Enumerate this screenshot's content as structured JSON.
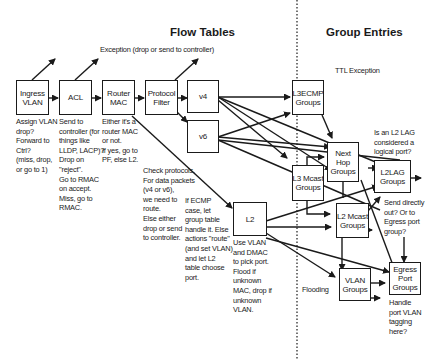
{
  "titles": {
    "flow_tables": "Flow Tables",
    "group_entries": "Group Entries"
  },
  "labels": {
    "exception": "Exception (drop or send to controller)",
    "ttl_exception": "TTL Exception",
    "flooding": "Flooding"
  },
  "flow_tables": {
    "ingress_vlan": "Ingress\nVLAN",
    "acl": "ACL",
    "router_mac": "Router\nMAC",
    "protocol_filter": "Protocol\nFilter",
    "v4": "v4",
    "v6": "v6",
    "l2": "L2"
  },
  "group_entries": {
    "l3ecmp": "L3ECMP\nGroups",
    "next_hop": "Next\nHop\nGroups",
    "l3_mcast": "L3 Mcast\nGroups",
    "l2lag": "L2LAG\nGroups",
    "l2_mcast": "L2 Mcast\nGroups",
    "vlan": "VLAN\nGroups",
    "egress_port": "Egress\nPort\nGroups"
  },
  "notes": {
    "ingress_vlan": "Assign VLAN\ndrop?\nForward to\nCtrl?\n(miss, drop,\nor go to 1)",
    "acl": "Send to\ncontroller (for\nthings like\nLLDP, LACP)?\nDrop on\n\"reject\".\nGo to RMAC\non accept.\nMiss, go to\nRMAC.",
    "router_mac": "Either it's a\nrouter MAC\nor not.\nIf yes, go to\nPF, else L2.",
    "protocol_filter": "Check protocols.\nFor data packets\n(v4 or v6),\nwe need to\nroute.\nElse either\ndrop or send\nto controller.",
    "ecmp": "If ECMP\ncase, let\ngroup table\nhandle it. Else\nactions \"route\"\n(and set VLAN)\nand let L2\ntable choose\nport.",
    "l2": "Use VLAN\nand DMAC\nto pick port.\nFlood if\nunknown\nMAC, drop if\nunknown\nVLAN.",
    "l2lag_question": "Is an L2 LAG\nconsidered a\nlogical port?",
    "send_directly": "Send directly\nout? Or to\nEgress port\ngroup?",
    "egress_port": "Handle\nport VLAN\ntagging\nhere?"
  }
}
